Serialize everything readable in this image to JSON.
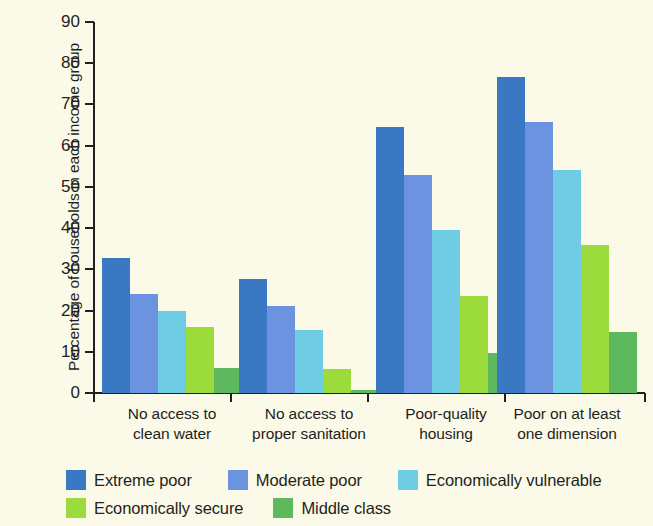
{
  "chart_data": {
    "type": "bar",
    "title": "",
    "xlabel": "",
    "ylabel": "Percentage of households in each income group",
    "ylim": [
      0,
      90
    ],
    "yticks": [
      0,
      10,
      20,
      30,
      40,
      50,
      60,
      70,
      80,
      90
    ],
    "ytick_labels": [
      "0",
      "10",
      "20",
      "30",
      "40",
      "50",
      "60",
      "70",
      "80",
      "90"
    ],
    "grid": false,
    "legend_position": "bottom-left",
    "categories": [
      "No access to clean water",
      "No access to proper sanitation",
      "Poor-quality housing",
      "Poor on at least one dimension"
    ],
    "category_lines": [
      [
        "No access to",
        "clean water"
      ],
      [
        "No access to",
        "proper sanitation"
      ],
      [
        "Poor-quality",
        "housing"
      ],
      [
        "Poor on at least",
        "one dimension"
      ]
    ],
    "series": [
      {
        "name": "Extreme poor",
        "color": "#3b78c4",
        "values": [
          32.8,
          27.7,
          64.6,
          76.7
        ]
      },
      {
        "name": "Moderate poor",
        "color": "#6b93e0",
        "values": [
          23.9,
          21.2,
          53.0,
          65.8
        ]
      },
      {
        "name": "Economically vulnerable",
        "color": "#6fcce4",
        "values": [
          19.8,
          15.4,
          39.6,
          54.1
        ]
      },
      {
        "name": "Economically secure",
        "color": "#9bdb3c",
        "values": [
          15.9,
          5.8,
          23.5,
          35.8
        ]
      },
      {
        "name": "Middle class",
        "color": "#5eb85e",
        "values": [
          6.1,
          0.8,
          9.7,
          14.9
        ]
      }
    ]
  },
  "style": {
    "background_color": "#fbfae8",
    "axis_color": "#231f20",
    "text_color": "#231f20"
  }
}
